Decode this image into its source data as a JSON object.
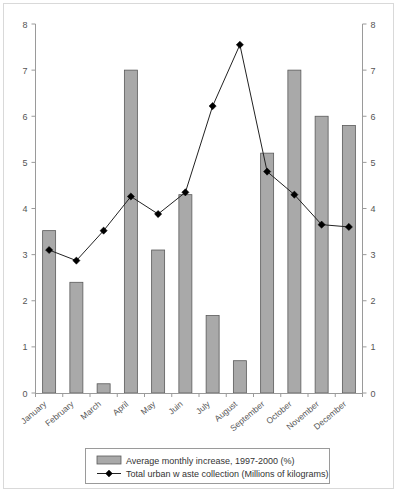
{
  "chart_data": {
    "type": "bar",
    "title": "",
    "subtitle": "",
    "xlabel": "",
    "ylabel": "",
    "ylim": [
      0,
      8
    ],
    "y2lim": [
      0,
      8
    ],
    "grid": false,
    "legend_position": "bottom",
    "categories": [
      "January",
      "February",
      "March",
      "April",
      "May",
      "Juin",
      "July",
      "August",
      "September",
      "October",
      "November",
      "December"
    ],
    "ytick_labels": [
      "0",
      "1",
      "2",
      "3",
      "4",
      "5",
      "6",
      "7",
      "8"
    ],
    "ytick_values": [
      0,
      1,
      2,
      3,
      4,
      5,
      6,
      7,
      8
    ],
    "y2tick_labels": [
      "0",
      "1",
      "2",
      "3",
      "4",
      "5",
      "6",
      "7",
      "8"
    ],
    "y2tick_values": [
      0,
      1,
      2,
      3,
      4,
      5,
      6,
      7,
      8
    ],
    "series": [
      {
        "name": "Average monthly increase, 1997-2000 (%)",
        "type": "bar",
        "axis": "left",
        "color": "#a9a9a9",
        "values": [
          3.52,
          2.4,
          0.2,
          7.0,
          3.1,
          4.3,
          1.68,
          0.7,
          5.2,
          7.0,
          6.0,
          5.8
        ]
      },
      {
        "name": "Total urban w aste collection (Millions of kilograms)",
        "type": "line",
        "axis": "right",
        "color": "#000000",
        "marker": "diamond",
        "values": [
          3.1,
          2.87,
          3.52,
          4.26,
          3.88,
          4.35,
          6.22,
          7.55,
          4.8,
          4.3,
          3.65,
          3.6
        ]
      }
    ]
  },
  "legend": {
    "items": [
      {
        "label": "Average monthly increase, 1997-2000 (%)",
        "marker": "bar-swatch"
      },
      {
        "label": "Total urban w aste collection (Millions of kilograms)",
        "marker": "line-diamond"
      }
    ]
  }
}
